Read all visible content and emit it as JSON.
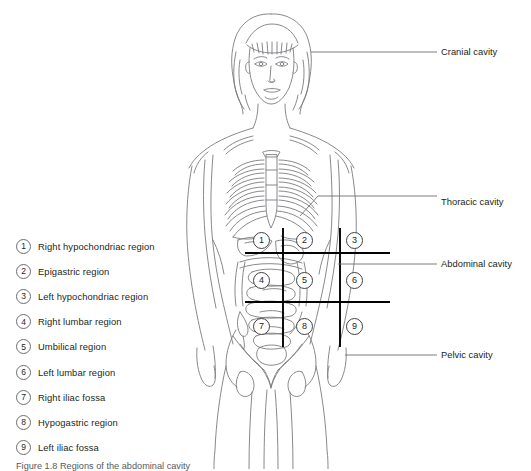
{
  "figure": {
    "caption": "Figure 1.8   Regions of the abdominal cavity"
  },
  "legend": {
    "items": [
      {
        "number": "1",
        "label": "Right hypochondriac region"
      },
      {
        "number": "2",
        "label": "Epigastric region"
      },
      {
        "number": "3",
        "label": "Left hypochondriac region"
      },
      {
        "number": "4",
        "label": "Right lumbar region"
      },
      {
        "number": "5",
        "label": "Umbilical region"
      },
      {
        "number": "6",
        "label": "Left lumbar region"
      },
      {
        "number": "7",
        "label": "Right iliac fossa"
      },
      {
        "number": "8",
        "label": "Hypogastric region"
      },
      {
        "number": "9",
        "label": "Left iliac fossa"
      }
    ]
  },
  "callouts": {
    "cranial": "Cranial cavity",
    "thoracic": "Thoracic cavity",
    "abdominal": "Abdominal cavity",
    "pelvic": "Pelvic cavity"
  },
  "regions": {
    "badges": [
      {
        "number": "1",
        "name": "right-hypochondriac"
      },
      {
        "number": "2",
        "name": "epigastric"
      },
      {
        "number": "3",
        "name": "left-hypochondriac"
      },
      {
        "number": "4",
        "name": "right-lumbar"
      },
      {
        "number": "5",
        "name": "umbilical"
      },
      {
        "number": "6",
        "name": "left-lumbar"
      },
      {
        "number": "7",
        "name": "right-iliac-fossa"
      },
      {
        "number": "8",
        "name": "hypogastric"
      },
      {
        "number": "9",
        "name": "left-iliac-fossa"
      }
    ]
  },
  "colors": {
    "background": "#ffffff",
    "text": "#231f20",
    "line_art": "#6d6e71",
    "grid_line": "#000000",
    "leader_line": "#58595b"
  }
}
